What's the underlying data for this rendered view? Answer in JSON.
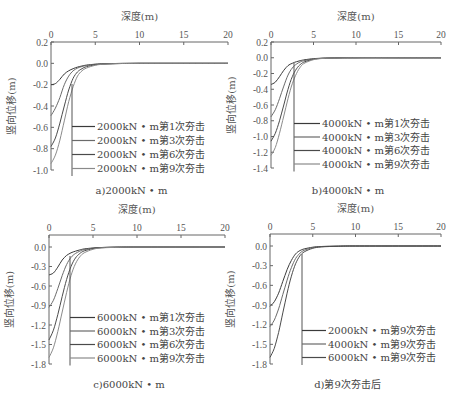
{
  "figure": {
    "panels": [
      {
        "id": "a",
        "caption": "a)2000kN • m",
        "xlabel": "深度(m)",
        "ylabel": "竖向位移(m)"
      },
      {
        "id": "b",
        "caption": "b)4000kN • m",
        "xlabel": "深度(m)",
        "ylabel": "竖向位移(m)"
      },
      {
        "id": "c",
        "caption": "c)6000kN • m",
        "xlabel": "深度(m)",
        "ylabel": "竖向位移(m)"
      },
      {
        "id": "d",
        "caption": "d)第9次夯击后",
        "xlabel": "深度(m)",
        "ylabel": "竖向位移(m)"
      }
    ]
  },
  "chart_data": [
    {
      "type": "line",
      "title": "a)2000kN • m",
      "xlabel": "深度(m)",
      "ylabel": "竖向位移(m)",
      "xlim": [
        0,
        20
      ],
      "ylim": [
        -1.0,
        0.2
      ],
      "xticks": [
        0,
        5,
        10,
        15,
        20
      ],
      "yticks": [
        0.2,
        0.0,
        -0.2,
        -0.4,
        -0.6,
        -0.8,
        -1.0
      ],
      "ytick_labels": [
        "0.2",
        "0.0",
        "-0.2",
        "-0.4",
        "-0.6",
        "-0.8",
        "-1.0"
      ],
      "legend_position": "inside lower center",
      "box": {
        "x0": 51,
        "x1": 228,
        "ytop": 42,
        "ybot": 170
      },
      "legend": {
        "x": 97,
        "y0": 130,
        "dy": 14,
        "vline_x": 72,
        "vline_top": 84
      },
      "x": [
        0,
        0.5,
        1,
        1.5,
        2,
        2.5,
        3,
        3.5,
        4,
        5,
        6,
        8,
        10,
        15,
        20
      ],
      "series": [
        {
          "name": "2000kN • m第1次夯击",
          "values": [
            -0.2,
            -0.19,
            -0.15,
            -0.1,
            -0.07,
            -0.05,
            -0.035,
            -0.025,
            -0.017,
            -0.008,
            -0.004,
            -0.001,
            0,
            0,
            0
          ]
        },
        {
          "name": "2000kN • m第3次夯击",
          "values": [
            -0.49,
            -0.42,
            -0.32,
            -0.2,
            -0.12,
            -0.07,
            -0.045,
            -0.03,
            -0.02,
            -0.009,
            -0.004,
            -0.001,
            0,
            0,
            0
          ]
        },
        {
          "name": "2000kN • m第6次夯击",
          "values": [
            -0.78,
            -0.7,
            -0.56,
            -0.4,
            -0.25,
            -0.14,
            -0.08,
            -0.05,
            -0.032,
            -0.014,
            -0.006,
            -0.002,
            0,
            0,
            0
          ]
        },
        {
          "name": "2000kN • m第9次夯击",
          "values": [
            -0.94,
            -0.86,
            -0.72,
            -0.54,
            -0.36,
            -0.22,
            -0.12,
            -0.07,
            -0.045,
            -0.018,
            -0.008,
            -0.002,
            0,
            0,
            0
          ]
        }
      ]
    },
    {
      "type": "line",
      "title": "b)4000kN • m",
      "xlabel": "深度(m)",
      "ylabel": "竖向位移(m)",
      "xlim": [
        0,
        20
      ],
      "ylim": [
        -1.4,
        0.2
      ],
      "xticks": [
        0,
        5,
        10,
        15,
        20
      ],
      "yticks": [
        0.2,
        0.0,
        -0.2,
        -0.4,
        -0.6,
        -0.8,
        -1.0,
        -1.2,
        -1.4
      ],
      "ytick_labels": [
        "0.2",
        "0.0",
        "-0.2",
        "-0.4",
        "-0.6",
        "-0.8",
        "-1.0",
        "-1.2",
        "-1.4"
      ],
      "legend_position": "inside lower center",
      "box": {
        "x0": 271,
        "x1": 441,
        "ytop": 42,
        "ybot": 168
      },
      "legend": {
        "x": 322,
        "y0": 127,
        "dy": 13.5,
        "vline_x": 294,
        "vline_top": 63
      },
      "x": [
        0,
        0.5,
        1,
        1.5,
        2,
        2.5,
        3,
        3.5,
        4,
        5,
        6,
        8,
        10,
        15,
        20
      ],
      "series": [
        {
          "name": "4000kN • m第1次夯击",
          "values": [
            -0.34,
            -0.31,
            -0.24,
            -0.16,
            -0.1,
            -0.07,
            -0.05,
            -0.035,
            -0.025,
            -0.012,
            -0.006,
            -0.002,
            0,
            0,
            0
          ]
        },
        {
          "name": "4000kN • m第3次夯击",
          "values": [
            -0.75,
            -0.66,
            -0.52,
            -0.36,
            -0.22,
            -0.13,
            -0.08,
            -0.05,
            -0.035,
            -0.015,
            -0.007,
            -0.002,
            0,
            0,
            0
          ]
        },
        {
          "name": "4000kN • m第6次夯击",
          "values": [
            -1.06,
            -0.96,
            -0.8,
            -0.6,
            -0.4,
            -0.24,
            -0.14,
            -0.08,
            -0.05,
            -0.02,
            -0.008,
            -0.002,
            0,
            0,
            0
          ]
        },
        {
          "name": "4000kN • m第9次夯击",
          "values": [
            -1.24,
            -1.14,
            -0.96,
            -0.74,
            -0.52,
            -0.33,
            -0.2,
            -0.11,
            -0.065,
            -0.025,
            -0.01,
            -0.003,
            0,
            0,
            0
          ]
        }
      ]
    },
    {
      "type": "line",
      "title": "c)6000kN • m",
      "xlabel": "深度(m)",
      "ylabel": "竖向位移(m)",
      "xlim": [
        0,
        20
      ],
      "ylim": [
        -1.8,
        0.15
      ],
      "xticks": [
        0,
        5,
        10,
        15,
        20
      ],
      "yticks": [
        0.0,
        -0.3,
        -0.6,
        -0.9,
        -1.2,
        -1.5,
        -1.8
      ],
      "ytick_labels": [
        "0.0",
        "-0.3",
        "-0.6",
        "-0.9",
        "-1.2",
        "-1.5",
        "-1.8"
      ],
      "legend_position": "inside lower center",
      "box": {
        "x0": 49,
        "x1": 225,
        "ytop": 235,
        "ybot": 364
      },
      "legend": {
        "x": 97,
        "y0": 321,
        "dy": 13.5,
        "vline_x": 70,
        "vline_top": 256
      },
      "x": [
        0,
        0.5,
        1,
        1.5,
        2,
        2.5,
        3,
        3.5,
        4,
        5,
        6,
        8,
        10,
        15,
        20
      ],
      "series": [
        {
          "name": "6000kN • m第1次夯击",
          "values": [
            -0.43,
            -0.4,
            -0.31,
            -0.2,
            -0.13,
            -0.09,
            -0.065,
            -0.045,
            -0.03,
            -0.015,
            -0.007,
            -0.002,
            0,
            0,
            0
          ]
        },
        {
          "name": "6000kN • m第3次夯击",
          "values": [
            -0.93,
            -0.82,
            -0.64,
            -0.44,
            -0.27,
            -0.16,
            -0.1,
            -0.065,
            -0.04,
            -0.018,
            -0.008,
            -0.002,
            0,
            0,
            0
          ]
        },
        {
          "name": "6000kN • m第6次夯击",
          "values": [
            -1.43,
            -1.28,
            -1.04,
            -0.76,
            -0.5,
            -0.3,
            -0.17,
            -0.1,
            -0.06,
            -0.025,
            -0.01,
            -0.003,
            0,
            0,
            0
          ]
        },
        {
          "name": "6000kN • m第9次夯击",
          "values": [
            -1.7,
            -1.55,
            -1.3,
            -1.0,
            -0.7,
            -0.44,
            -0.26,
            -0.15,
            -0.09,
            -0.035,
            -0.014,
            -0.004,
            0,
            0,
            0
          ]
        }
      ]
    },
    {
      "type": "line",
      "title": "d)第9次夯击后",
      "xlabel": "深度(m)",
      "ylabel": "竖向位移(m)",
      "xlim": [
        0,
        20
      ],
      "ylim": [
        -1.8,
        0.15
      ],
      "xticks": [
        0,
        5,
        10,
        15,
        20
      ],
      "yticks": [
        0.0,
        -0.3,
        -0.6,
        -0.9,
        -1.2,
        -1.5,
        -1.8
      ],
      "ytick_labels": [
        "0.0",
        "-0.3",
        "-0.6",
        "-0.9",
        "-1.2",
        "-1.5",
        "-1.8"
      ],
      "legend_position": "inside lower center",
      "box": {
        "x0": 270,
        "x1": 441,
        "ytop": 234,
        "ybot": 364
      },
      "legend": {
        "x": 328,
        "y0": 334,
        "dy": 13.5,
        "vline_x": 302,
        "vline_top": 254
      },
      "x": [
        0,
        0.5,
        1,
        1.5,
        2,
        2.5,
        3,
        3.5,
        4,
        5,
        6,
        8,
        10,
        15,
        20
      ],
      "series": [
        {
          "name": "2000kN • m第9次夯击",
          "values": [
            -0.92,
            -0.85,
            -0.72,
            -0.54,
            -0.36,
            -0.22,
            -0.12,
            -0.07,
            -0.045,
            -0.018,
            -0.008,
            -0.002,
            0,
            0,
            0
          ]
        },
        {
          "name": "4000kN • m第9次夯击",
          "values": [
            -1.23,
            -1.13,
            -0.96,
            -0.74,
            -0.52,
            -0.33,
            -0.19,
            -0.11,
            -0.065,
            -0.025,
            -0.01,
            -0.003,
            0,
            0,
            0
          ]
        },
        {
          "name": "6000kN • m第9次夯击",
          "values": [
            -1.7,
            -1.56,
            -1.32,
            -1.02,
            -0.72,
            -0.46,
            -0.27,
            -0.15,
            -0.09,
            -0.035,
            -0.014,
            -0.004,
            0,
            0,
            0
          ]
        }
      ]
    }
  ],
  "style": {
    "axis_color": "#666666",
    "line_colors": [
      "#3a3a3a",
      "#6a6a6a",
      "#4a4a4a",
      "#8a8a8a"
    ]
  }
}
